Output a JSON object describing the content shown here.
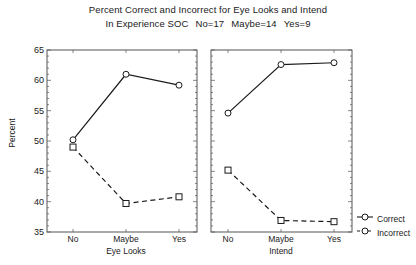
{
  "title": {
    "line1": "Percent Correct and Incorrect for Eye Looks and Intend",
    "line2_prefix": "In Experience SOC",
    "line2_no": "No=17",
    "line2_maybe": "Maybe=14",
    "line2_yes": "Yes=9"
  },
  "axes": {
    "ylabel": "Percent",
    "yticks": [
      "65",
      "60",
      "55",
      "50",
      "45",
      "40",
      "35"
    ]
  },
  "legend": {
    "entries": [
      {
        "label": "Correct",
        "style": "solid",
        "marker": "circle"
      },
      {
        "label": "Incorrect",
        "style": "dashed",
        "marker": "circle"
      }
    ]
  },
  "panels": [
    {
      "name": "Eye Looks",
      "xlabel": "Eye Looks",
      "xticks": [
        "No",
        "Maybe",
        "Yes"
      ]
    },
    {
      "name": "Intend",
      "xlabel": "Intend",
      "xticks": [
        "No",
        "Maybe",
        "Yes"
      ]
    }
  ],
  "colors": {
    "line": "#1a1a1a",
    "axis": "#555555",
    "background": "#ffffff"
  },
  "chart_data": {
    "type": "line",
    "title": "Percent Correct and Incorrect for Eye Looks and Intend",
    "subtitle": "In Experience SOC   No=17   Maybe=14   Yes=9",
    "xlabel": "",
    "ylabel": "Percent",
    "ylim": [
      35,
      65
    ],
    "ytick_step": 5,
    "grid": false,
    "legend_position": "right-bottom",
    "panels": [
      {
        "panel": "Eye Looks",
        "categories": [
          "No",
          "Maybe",
          "Yes"
        ],
        "series": [
          {
            "name": "Correct",
            "values": [
              50.2,
              61.0,
              59.2
            ],
            "style": "solid",
            "marker": "circle"
          },
          {
            "name": "Incorrect",
            "values": [
              49.0,
              39.7,
              40.8
            ],
            "style": "dashed",
            "marker": "square"
          }
        ]
      },
      {
        "panel": "Intend",
        "categories": [
          "No",
          "Maybe",
          "Yes"
        ],
        "series": [
          {
            "name": "Correct",
            "values": [
              54.6,
              62.6,
              62.9
            ],
            "style": "solid",
            "marker": "circle"
          },
          {
            "name": "Incorrect",
            "values": [
              45.2,
              36.9,
              36.7
            ],
            "style": "dashed",
            "marker": "square"
          }
        ]
      }
    ]
  }
}
